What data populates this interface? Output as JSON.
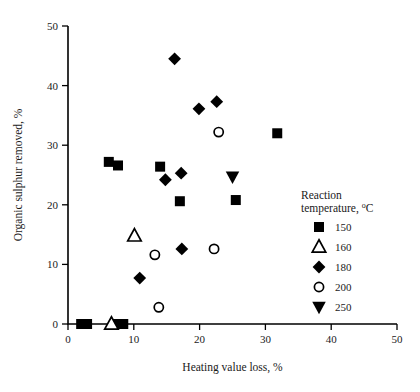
{
  "chart_data": {
    "type": "scatter",
    "title": "",
    "xlabel": "Heating value loss, %",
    "ylabel": "Organic sulphur removed, %",
    "xlim": [
      0,
      50
    ],
    "ylim": [
      0,
      50
    ],
    "xticks": [
      0,
      10,
      20,
      30,
      40,
      50
    ],
    "yticks": [
      0,
      10,
      20,
      30,
      40,
      50
    ],
    "xtick_labels": [
      "0",
      "10",
      "20",
      "30",
      "40",
      "50"
    ],
    "ytick_labels": [
      "0",
      "10",
      "20",
      "30",
      "40",
      "50"
    ],
    "grid": false,
    "legend_position": "right",
    "legend_title_line1": "Reaction",
    "legend_title_line2": "temperature, °C",
    "series": [
      {
        "name": "150",
        "label": "150",
        "marker": "filled-square",
        "color": "#000000",
        "points": [
          {
            "x": 6.2,
            "y": 27.2
          },
          {
            "x": 7.6,
            "y": 26.6
          },
          {
            "x": 14.0,
            "y": 26.4
          },
          {
            "x": 17.0,
            "y": 20.6
          },
          {
            "x": 25.5,
            "y": 20.8
          },
          {
            "x": 31.8,
            "y": 32.0
          },
          {
            "x": 2.0,
            "y": 0.0
          },
          {
            "x": 2.9,
            "y": 0.0
          },
          {
            "x": 7.4,
            "y": 0.0
          },
          {
            "x": 8.4,
            "y": 0.0
          }
        ]
      },
      {
        "name": "160",
        "label": "160",
        "marker": "open-triangle-up",
        "color": "#000000",
        "points": [
          {
            "x": 10.1,
            "y": 14.8
          },
          {
            "x": 6.6,
            "y": 0.0
          }
        ]
      },
      {
        "name": "180",
        "label": "180",
        "marker": "filled-diamond",
        "color": "#000000",
        "points": [
          {
            "x": 16.2,
            "y": 44.5
          },
          {
            "x": 19.9,
            "y": 36.1
          },
          {
            "x": 22.6,
            "y": 37.3
          },
          {
            "x": 14.8,
            "y": 24.2
          },
          {
            "x": 17.2,
            "y": 25.3
          },
          {
            "x": 17.3,
            "y": 12.6
          },
          {
            "x": 10.9,
            "y": 7.7
          }
        ]
      },
      {
        "name": "200",
        "label": "200",
        "marker": "open-circle",
        "color": "#000000",
        "points": [
          {
            "x": 22.9,
            "y": 32.2
          },
          {
            "x": 13.2,
            "y": 11.6
          },
          {
            "x": 22.2,
            "y": 12.6
          },
          {
            "x": 13.8,
            "y": 2.8
          }
        ]
      },
      {
        "name": "250",
        "label": "250",
        "marker": "filled-triangle-down",
        "color": "#000000",
        "points": [
          {
            "x": 25.0,
            "y": 24.7
          }
        ]
      }
    ]
  }
}
